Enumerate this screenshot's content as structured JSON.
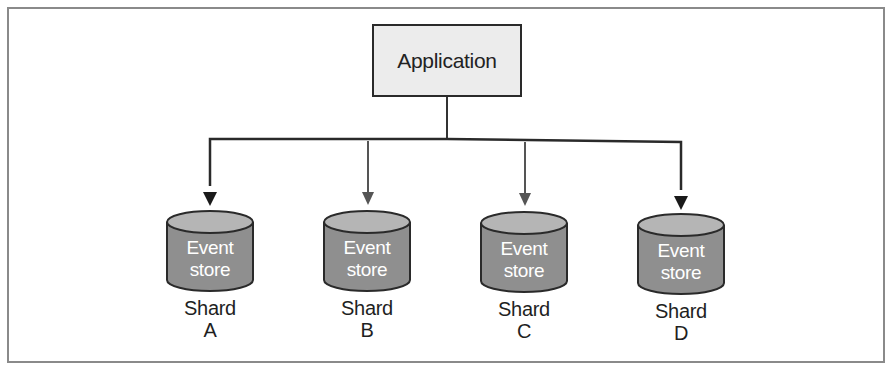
{
  "diagram": {
    "application": {
      "label": "Application"
    },
    "shards": [
      {
        "store_line1": "Event",
        "store_line2": "store",
        "name_line1": "Shard",
        "name_line2": "A"
      },
      {
        "store_line1": "Event",
        "store_line2": "store",
        "name_line1": "Shard",
        "name_line2": "B"
      },
      {
        "store_line1": "Event",
        "store_line2": "store",
        "name_line1": "Shard",
        "name_line2": "C"
      },
      {
        "store_line1": "Event",
        "store_line2": "store",
        "name_line1": "Shard",
        "name_line2": "D"
      }
    ],
    "colors": {
      "frame": "#8a8a8a",
      "app_fill": "#ececec",
      "cylinder_fill": "#8f8f8f",
      "cylinder_top": "#b5b5b5",
      "line": "#2a2a2a",
      "arrow_inner": "#555555"
    }
  }
}
